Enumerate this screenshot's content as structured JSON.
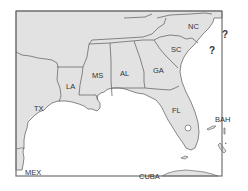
{
  "map": {
    "title": "",
    "colors": {
      "land": "#e2e2e2",
      "water": "#ffffff",
      "border": "#6a6a6a",
      "frame": "#707070",
      "label": "#333333"
    },
    "states": [
      {
        "id": "TX",
        "label": "TX"
      },
      {
        "id": "LA",
        "label": "LA"
      },
      {
        "id": "MS",
        "label": "MS"
      },
      {
        "id": "AL",
        "label": "AL"
      },
      {
        "id": "GA",
        "label": "GA"
      },
      {
        "id": "SC",
        "label": "SC"
      },
      {
        "id": "NC",
        "label": "NC"
      },
      {
        "id": "FL",
        "label": "FL"
      }
    ],
    "countries": [
      {
        "id": "MEX",
        "label": "MEX"
      },
      {
        "id": "CUBA",
        "label": "CUBA"
      },
      {
        "id": "BAH",
        "label": "BAH"
      }
    ],
    "markers": [
      {
        "id": "question-1",
        "label": "?"
      },
      {
        "id": "question-2",
        "label": "?"
      }
    ]
  }
}
